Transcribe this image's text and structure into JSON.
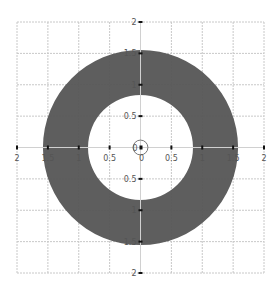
{
  "chart_data": {
    "type": "area",
    "title": "",
    "subtitle": "",
    "xlabel": "",
    "ylabel": "",
    "xlim": [
      -2,
      2
    ],
    "ylim": [
      -2,
      2
    ],
    "grid": true,
    "legend": null,
    "axes_style": "centered-cross",
    "x_ticks": [
      -2,
      -1.5,
      -1,
      -0.5,
      0,
      0.5,
      1,
      1.5,
      2
    ],
    "y_ticks": [
      -2,
      -1.5,
      -1,
      -0.5,
      0,
      0.5,
      1,
      1.5,
      2
    ],
    "x_tick_labels": [
      "2",
      "1.5",
      "1",
      "0.5",
      "0",
      "0.5",
      "1",
      "1.5",
      "2"
    ],
    "y_tick_labels": [
      "2",
      "1.5",
      "1",
      "0.5",
      "0",
      "0.5",
      "1",
      "1.5",
      "2"
    ],
    "shapes": [
      {
        "kind": "annulus",
        "center": [
          0,
          0
        ],
        "inner_radius": 0.85,
        "outer_radius": 1.58,
        "fill": "#555555"
      },
      {
        "kind": "circle-marker",
        "center": [
          0,
          0
        ],
        "radius": 0.12,
        "stroke": "#777777",
        "fill": "none"
      }
    ],
    "origin_labels": {
      "x": "0",
      "y": "0"
    }
  },
  "colors": {
    "background": "#ffffff",
    "grid": "#c8c8c8",
    "axis": "#d0d0d0",
    "ring": "#555555",
    "tick_mark": "#111111",
    "tick_label": "#555555"
  }
}
